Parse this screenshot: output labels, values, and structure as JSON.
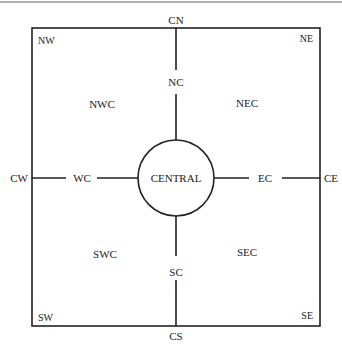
{
  "diagram": {
    "corners": {
      "nw": "NW",
      "ne": "NE",
      "sw": "SW",
      "se": "SE"
    },
    "edges": {
      "cn": "CN",
      "cs": "CS",
      "cw": "CW",
      "ce": "CE"
    },
    "inner": {
      "nc": "NC",
      "sc": "SC",
      "wc": "WC",
      "ec": "EC"
    },
    "quadrants": {
      "nwc": "NWC",
      "nec": "NEC",
      "swc": "SWC",
      "sec": "SEC"
    },
    "center": "CENTRAL",
    "colors": {
      "line": "#222222",
      "text": "#222222",
      "background": "#ffffff"
    }
  }
}
